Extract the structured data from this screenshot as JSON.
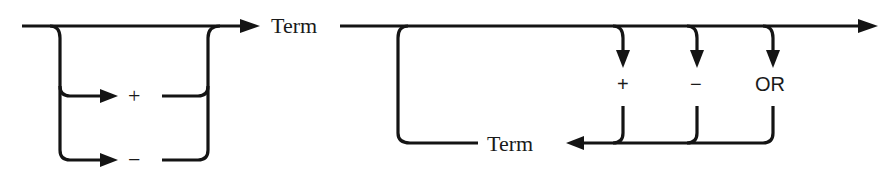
{
  "diagram": {
    "type": "syntax-railroad-diagram",
    "line_color": "#141414",
    "background": "#ffffff",
    "sign_choice": {
      "options": [
        {
          "label": "+",
          "role": "optional-sign"
        },
        {
          "label": "−",
          "role": "optional-sign"
        }
      ],
      "bypass": true
    },
    "first_term": {
      "label": "Term"
    },
    "repeat_loop": {
      "operators": [
        {
          "label": "+"
        },
        {
          "label": "−"
        },
        {
          "label": "OR"
        }
      ],
      "return_term": {
        "label": "Term"
      }
    }
  }
}
